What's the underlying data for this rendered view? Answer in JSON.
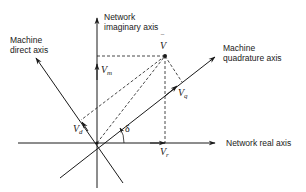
{
  "diagram": {
    "type": "phasor-diagram",
    "axes": {
      "network_imaginary": {
        "line1": "Network",
        "line2": "imaginary axis"
      },
      "network_real": {
        "label": "Network real axis"
      },
      "machine_direct": {
        "line1": "Machine",
        "line2": "direct axis"
      },
      "machine_quadrature": {
        "line1": "Machine",
        "line2": "quadrature axis"
      }
    },
    "vectors": {
      "v_bar": {
        "symbol": "V",
        "overbar": "‾"
      },
      "v_m": {
        "base": "V",
        "sub": "m"
      },
      "v_r": {
        "base": "V",
        "sub": "r"
      },
      "v_d": {
        "base": "V",
        "sub": "d"
      },
      "v_q": {
        "base": "V",
        "sub": "q"
      }
    },
    "angle": {
      "symbol": "δ"
    },
    "colors": {
      "ink": "#1a1a1a",
      "background": "#ffffff"
    }
  }
}
